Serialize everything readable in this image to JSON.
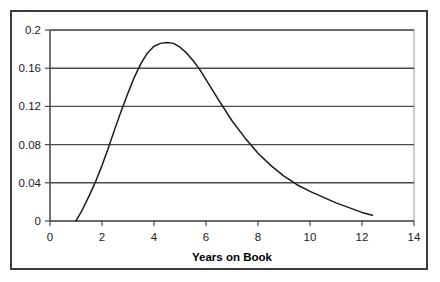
{
  "chart_data": {
    "type": "line",
    "title": "",
    "xlabel": "Years on Book",
    "ylabel": "",
    "xlim": [
      0,
      14
    ],
    "ylim": [
      0,
      0.2
    ],
    "grid": "horizontal",
    "legend": "none",
    "x_ticks": [
      "0",
      "2",
      "4",
      "6",
      "8",
      "10",
      "12",
      "14"
    ],
    "x_tick_values": [
      0,
      2,
      4,
      6,
      8,
      10,
      12,
      14
    ],
    "y_ticks": [
      "0",
      "0.04",
      "0.08",
      "0.12",
      "0.16",
      "0.2"
    ],
    "y_tick_values": [
      0,
      0.04,
      0.08,
      0.12,
      0.16,
      0.2
    ],
    "series": [
      {
        "name": "hazard",
        "x": [
          1.0,
          1.25,
          1.5,
          1.75,
          2.0,
          2.25,
          2.5,
          2.75,
          3.0,
          3.25,
          3.5,
          3.75,
          4.0,
          4.25,
          4.5,
          4.75,
          5.0,
          5.25,
          5.5,
          5.75,
          6.0,
          6.5,
          7.0,
          7.5,
          8.0,
          8.5,
          9.0,
          9.5,
          10.0,
          10.5,
          11.0,
          11.5,
          12.0,
          12.4
        ],
        "y": [
          0.0,
          0.012,
          0.026,
          0.041,
          0.058,
          0.077,
          0.097,
          0.116,
          0.134,
          0.151,
          0.165,
          0.176,
          0.183,
          0.186,
          0.187,
          0.186,
          0.182,
          0.176,
          0.168,
          0.159,
          0.148,
          0.126,
          0.105,
          0.087,
          0.071,
          0.058,
          0.047,
          0.038,
          0.031,
          0.025,
          0.019,
          0.014,
          0.009,
          0.006
        ]
      }
    ]
  },
  "axis": {
    "x_label": "Years on Book"
  },
  "style": {
    "line_color": "#1a1a1a",
    "grid_color": "#4a4a4a",
    "frame_color": "#3b3b3b",
    "plot_border_color": "#8c8c8c",
    "background": "#ffffff"
  }
}
